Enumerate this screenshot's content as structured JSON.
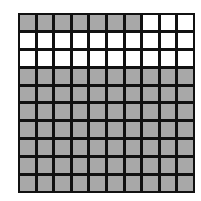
{
  "diagram": {
    "type": "hundred-grid",
    "rows": 10,
    "columns": 10,
    "shaded_count": 77,
    "unshaded_count": 23,
    "shaded_color": "#a8a8a8",
    "unshaded_color": "#ffffff",
    "line_color": "#111111",
    "cells": [
      [
        1,
        1,
        1,
        1,
        1,
        1,
        1,
        0,
        0,
        0
      ],
      [
        0,
        0,
        0,
        0,
        0,
        0,
        0,
        0,
        0,
        0
      ],
      [
        0,
        0,
        0,
        0,
        0,
        0,
        0,
        0,
        0,
        0
      ],
      [
        1,
        1,
        1,
        1,
        1,
        1,
        1,
        1,
        1,
        1
      ],
      [
        1,
        1,
        1,
        1,
        1,
        1,
        1,
        1,
        1,
        1
      ],
      [
        1,
        1,
        1,
        1,
        1,
        1,
        1,
        1,
        1,
        1
      ],
      [
        1,
        1,
        1,
        1,
        1,
        1,
        1,
        1,
        1,
        1
      ],
      [
        1,
        1,
        1,
        1,
        1,
        1,
        1,
        1,
        1,
        1
      ],
      [
        1,
        1,
        1,
        1,
        1,
        1,
        1,
        1,
        1,
        1
      ],
      [
        1,
        1,
        1,
        1,
        1,
        1,
        1,
        1,
        1,
        1
      ]
    ]
  }
}
